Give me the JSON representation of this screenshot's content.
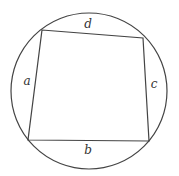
{
  "diagram": {
    "type": "cyclic-quadrilateral",
    "stroke_color": "#444444",
    "background": "#ffffff",
    "circle": {
      "cx": 89,
      "cy": 91,
      "r": 78
    },
    "vertices": {
      "top_left": [
        42,
        30
      ],
      "top_right": [
        143,
        38
      ],
      "bottom_right": [
        149,
        141
      ],
      "bottom_left": [
        28,
        140
      ]
    },
    "sides": [
      {
        "name": "d",
        "label": "d",
        "from": "top_left",
        "to": "top_right",
        "label_pos": [
          88,
          28
        ]
      },
      {
        "name": "c",
        "label": "c",
        "from": "top_right",
        "to": "bottom_right",
        "label_pos": [
          154,
          88
        ]
      },
      {
        "name": "b",
        "label": "b",
        "from": "bottom_right",
        "to": "bottom_left",
        "label_pos": [
          88,
          154
        ]
      },
      {
        "name": "a",
        "label": "a",
        "from": "bottom_left",
        "to": "top_left",
        "label_pos": [
          26,
          85
        ]
      }
    ]
  }
}
